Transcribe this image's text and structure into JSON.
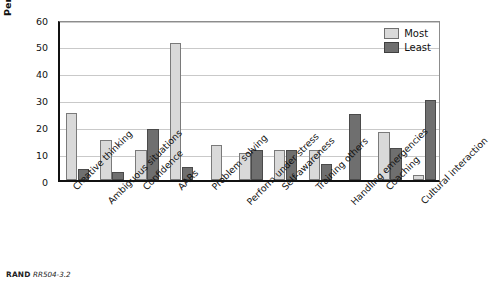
{
  "chart_data": {
    "type": "bar",
    "title": "",
    "xlabel": "",
    "ylabel": "Percentage",
    "ylim": [
      0,
      60
    ],
    "yticks": [
      0,
      10,
      20,
      30,
      40,
      50,
      60
    ],
    "grid": true,
    "legend_position": "top-right",
    "categories": [
      "Creative thinking",
      "Ambiguous situations",
      "Confidence",
      "AARs",
      "Problem solving",
      "Perform under stress",
      "Self-awareness",
      "Training others",
      "Handling emergencies",
      "Coaching",
      "Cultural interaction"
    ],
    "series": [
      {
        "name": "Most",
        "color": "#d9d9d9",
        "values": [
          25,
          15,
          11,
          51,
          13,
          10,
          11,
          11,
          null,
          18,
          2
        ]
      },
      {
        "name": "Least",
        "color": "#6f6f6f",
        "values": [
          4,
          3,
          19,
          5,
          null,
          11,
          11,
          6,
          24.5,
          12,
          30
        ]
      }
    ]
  },
  "legend": {
    "items": [
      {
        "label": "Most",
        "swatch": "most-swatch"
      },
      {
        "label": "Least",
        "swatch": "least-swatch"
      }
    ]
  },
  "footer": {
    "org": "RAND",
    "figure_id": "RR504-3.2"
  }
}
